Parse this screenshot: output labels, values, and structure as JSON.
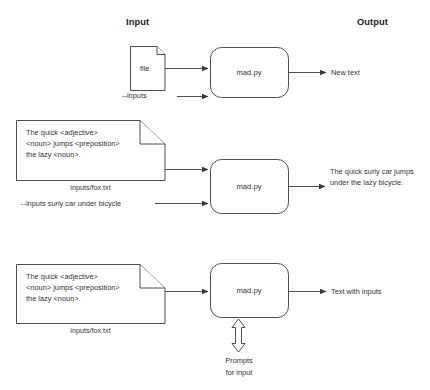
{
  "canvas": {
    "width": 430,
    "height": 390,
    "background": "#ffffff",
    "stroke": "#3a3a3a"
  },
  "headers": {
    "input": "Input",
    "output": "Output"
  },
  "rows": [
    {
      "id": "row-basic",
      "file_icon_label": "file",
      "flag_label": "--inputs",
      "process_label": "mad.py",
      "output_label": "New text"
    },
    {
      "id": "row-inputs-flag",
      "document_text": "The quick <adjective>\n<noun> jumps <preposition>\nthe lazy <noun>.",
      "document_caption": "inputs/fox.txt",
      "flag_label": "--inputs surly car under bicycle",
      "process_label": "mad.py",
      "output_label": "The quick surly car jumps under the lazy bicycle."
    },
    {
      "id": "row-prompts",
      "document_text": "The quick <adjective>\n<noun> jumps <preposition>\nthe lazy <noun>.",
      "document_caption": "inputs/fox.txt",
      "process_label": "mad.py",
      "output_label": "Text with inputs",
      "prompt_label": "Prompts\nfor input"
    }
  ],
  "icons": {
    "document": "document-page-icon",
    "arrow": "arrow-right-icon",
    "double_arrow": "double-headed-arrow-icon"
  }
}
